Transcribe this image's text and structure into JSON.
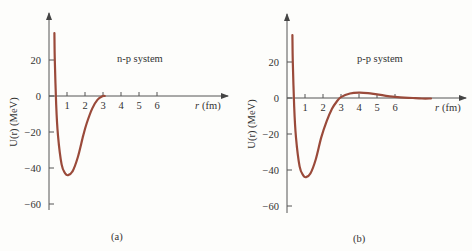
{
  "chart_data": [
    {
      "type": "line",
      "panel": "(a)",
      "title": "n-p system",
      "xlabel": "r (fm)",
      "ylabel": "U(r) (MeV)",
      "x_ticks": [
        1,
        2,
        3,
        4,
        5,
        6
      ],
      "y_ticks": [
        20,
        0,
        -20,
        -40,
        -60
      ],
      "xlim": [
        0,
        9.8
      ],
      "ylim": [
        -62,
        46
      ],
      "grid": false,
      "series": [
        {
          "name": "n-p potential",
          "color": "#9a4a3a",
          "x": [
            0.3,
            0.32,
            0.4,
            0.5,
            0.7,
            0.9,
            1.05,
            1.3,
            1.6,
            1.9,
            2.1,
            2.4,
            2.7,
            3.0,
            3.1
          ],
          "y": [
            35,
            20,
            -5,
            -22,
            -38,
            -43,
            -44,
            -42,
            -34,
            -22,
            -15,
            -7,
            -2,
            0,
            0
          ]
        }
      ]
    },
    {
      "type": "line",
      "panel": "(b)",
      "title": "p-p system",
      "xlabel": "r (fm)",
      "ylabel": "U(r) (MeV)",
      "x_ticks": [
        1,
        2,
        3,
        4,
        5,
        6
      ],
      "y_ticks": [
        20,
        0,
        -20,
        -40,
        -60
      ],
      "xlim": [
        0,
        9.9
      ],
      "ylim": [
        -62,
        46
      ],
      "grid": false,
      "series": [
        {
          "name": "p-p potential",
          "color": "#9a4a3a",
          "x": [
            0.3,
            0.32,
            0.4,
            0.5,
            0.7,
            0.9,
            1.05,
            1.3,
            1.6,
            1.9,
            2.2,
            2.5,
            2.8,
            3.0,
            3.5,
            4.0,
            4.5,
            5.0,
            5.5,
            6.0,
            6.5,
            7.0,
            7.5,
            8.0
          ],
          "y": [
            35,
            20,
            -5,
            -22,
            -38,
            -43,
            -44,
            -42,
            -34,
            -22,
            -13,
            -6,
            -1.5,
            0.5,
            2.5,
            3,
            2.7,
            2,
            1.2,
            0.6,
            0.2,
            0,
            -0.3,
            -0.3
          ]
        }
      ]
    }
  ],
  "panels": [
    {
      "title": "n-p system",
      "caption": "(a)",
      "xlabel_r": "r",
      "xlabel_unit": "(fm)",
      "ylabel": "U(r)  (MeV)",
      "xtick_labels": [
        "1",
        "2",
        "3",
        "4",
        "5",
        "6"
      ],
      "ytick_labels": [
        "20",
        "0",
        "−20",
        "−40",
        "−60"
      ]
    },
    {
      "title": "p-p system",
      "caption": "(b)",
      "xlabel_r": "r",
      "xlabel_unit": "(fm)",
      "ylabel": "U(r)  (MeV)",
      "xtick_labels": [
        "1",
        "2",
        "3",
        "4",
        "5",
        "6"
      ],
      "ytick_labels": [
        "20",
        "0",
        "−20",
        "−40",
        "−60"
      ]
    }
  ]
}
